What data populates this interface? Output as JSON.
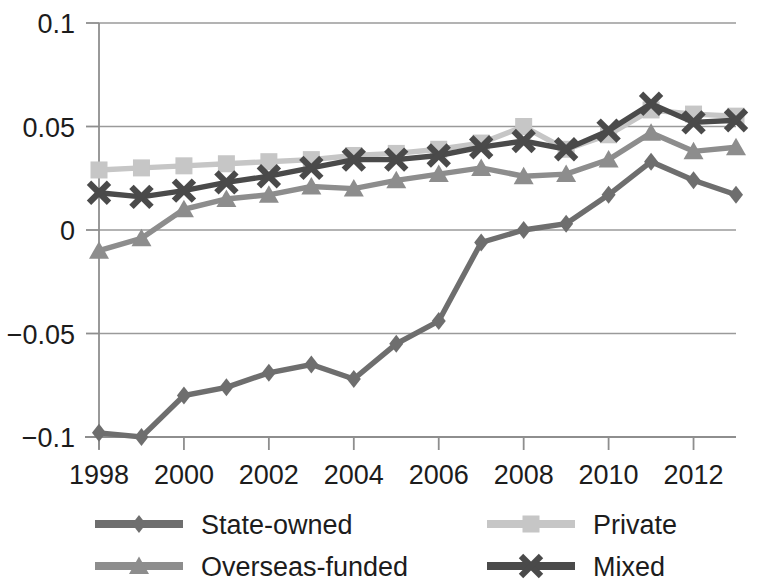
{
  "chart_data": {
    "type": "line",
    "title": "",
    "subtitle": "",
    "xlabel": "",
    "ylabel": "",
    "grid": true,
    "legend_position": "bottom",
    "xlim": [
      1998,
      2013
    ],
    "ylim": [
      -0.1,
      0.1
    ],
    "x": [
      1998,
      1999,
      2000,
      2001,
      2002,
      2003,
      2004,
      2005,
      2006,
      2007,
      2008,
      2009,
      2010,
      2011,
      2012,
      2013
    ],
    "x_tick_labels": [
      "1998",
      "2000",
      "2002",
      "2004",
      "2006",
      "2008",
      "2010",
      "2012"
    ],
    "x_ticks": [
      1998,
      2000,
      2002,
      2004,
      2006,
      2008,
      2010,
      2012
    ],
    "y_tick_labels": [
      "0.1",
      "0.05",
      "0",
      "-0.05",
      "-0.1"
    ],
    "y_ticks": [
      0.1,
      0.05,
      0,
      -0.05,
      -0.1
    ],
    "series": [
      {
        "name": "State-owned",
        "marker": "diamond",
        "color": "#6e6e6e",
        "values": [
          -0.098,
          -0.1,
          -0.08,
          -0.076,
          -0.069,
          -0.065,
          -0.072,
          -0.055,
          -0.044,
          -0.006,
          0.0,
          0.003,
          0.017,
          0.033,
          0.024,
          0.017
        ]
      },
      {
        "name": "Private",
        "marker": "square",
        "color": "#c6c6c6",
        "values": [
          0.029,
          0.03,
          0.031,
          0.032,
          0.033,
          0.034,
          0.036,
          0.037,
          0.039,
          0.042,
          0.05,
          0.039,
          0.046,
          0.058,
          0.056,
          0.055
        ]
      },
      {
        "name": "Overseas-funded",
        "marker": "triangle",
        "color": "#8d8d8d",
        "values": [
          -0.01,
          -0.004,
          0.01,
          0.015,
          0.017,
          0.021,
          0.02,
          0.024,
          0.027,
          0.03,
          0.026,
          0.027,
          0.034,
          0.047,
          0.038,
          0.04
        ]
      },
      {
        "name": "Mixed",
        "marker": "cross",
        "color": "#4a4a4a",
        "values": [
          0.018,
          0.016,
          0.019,
          0.023,
          0.026,
          0.03,
          0.034,
          0.034,
          0.036,
          0.04,
          0.043,
          0.039,
          0.048,
          0.061,
          0.052,
          0.053
        ]
      }
    ]
  },
  "legend": {
    "items": [
      {
        "label": "State-owned",
        "marker": "diamond",
        "color": "#6e6e6e"
      },
      {
        "label": "Private",
        "marker": "square",
        "color": "#c6c6c6"
      },
      {
        "label": "Overseas-funded",
        "marker": "triangle",
        "color": "#8d8d8d"
      },
      {
        "label": "Mixed",
        "marker": "cross",
        "color": "#4a4a4a"
      }
    ]
  }
}
